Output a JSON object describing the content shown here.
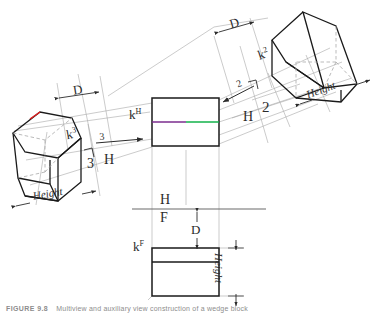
{
  "figure": {
    "caption_label": "FIGURE 9.8",
    "caption_text": "Multiview and auxiliary view construction of a wedge block",
    "colors": {
      "line": "#1a1a1a",
      "construction": "#9a9a9a",
      "hidden": "#aaaaaa",
      "text": "#2b2b2b",
      "accent_purple": "#7b2d8e",
      "accent_green": "#12b24a",
      "accent_red": "#e02020",
      "caption": "#8d8d8d",
      "background": "#ffffff"
    }
  },
  "views": {
    "horizontal": {
      "name": "k-H",
      "label": "k",
      "label_sup": "H",
      "description": "Top (horizontal) view rectangle with edge line"
    },
    "frontal": {
      "name": "k-F",
      "label": "k",
      "label_sup": "F",
      "description": "Front (frontal) view rectangle"
    },
    "auxiliary_two": {
      "name": "k-2",
      "label": "k",
      "label_sup": "2",
      "description": "Pictorial auxiliary view 2 of the wedge"
    },
    "auxiliary_three": {
      "name": "k-3",
      "label": "k",
      "label_sup": "3",
      "description": "Pictorial auxiliary view 3 of the wedge"
    }
  },
  "fold_lines": [
    {
      "id": "hf",
      "upper": "H",
      "lower": "F",
      "note": "H over F fold line"
    },
    {
      "id": "h3",
      "left": "3",
      "right": "H",
      "note": "3 over H fold line with arrow 3"
    },
    {
      "id": "h2",
      "left": "H",
      "right": "2",
      "note": "H over 2 fold line with arrow 2"
    }
  ],
  "direction_arrows": [
    {
      "id": "arrow-3",
      "label": "3",
      "points": "right"
    },
    {
      "id": "arrow-2",
      "label": "2",
      "points": "left"
    }
  ],
  "dimensions": [
    {
      "id": "dim-d-left",
      "label": "D"
    },
    {
      "id": "dim-d-right",
      "label": "D"
    },
    {
      "id": "dim-d-front",
      "label": "D"
    },
    {
      "id": "dim-height-left",
      "label": "Height"
    },
    {
      "id": "dim-height-right",
      "label": "Height"
    },
    {
      "id": "dim-height-front",
      "label": "Height"
    }
  ],
  "symbols": [
    {
      "id": "perp-symbol-3",
      "glyph": "perpendicular-corner"
    },
    {
      "id": "perp-symbol-2",
      "glyph": "perpendicular-corner"
    }
  ]
}
